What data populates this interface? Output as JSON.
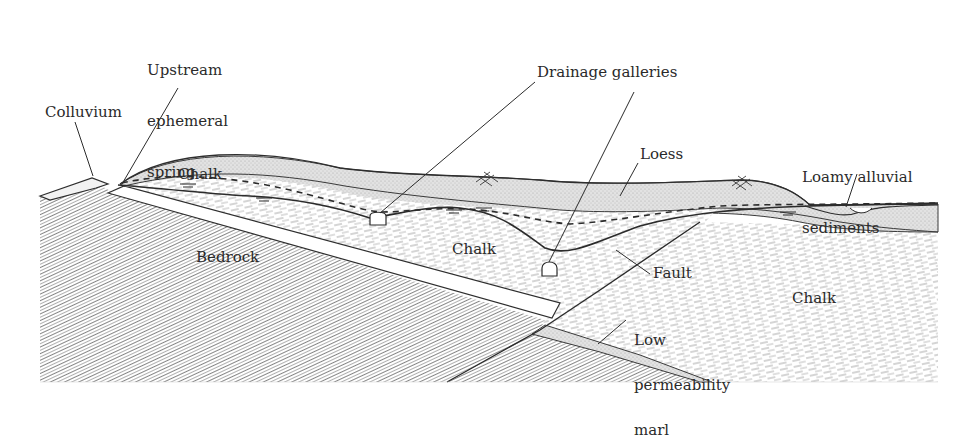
{
  "figure": {
    "type": "geological cross-section",
    "colors": {
      "line": "#2e2e2e",
      "hatch_bedrock": "#8a8a8a",
      "hatch_chalk": "#9a9a9a",
      "loess_fill": "#d6d6d6",
      "marl_fill": "#dedede",
      "background": "#ffffff"
    }
  },
  "labels": {
    "upstream_spring": [
      "Upstream",
      "ephemeral",
      "spring"
    ],
    "colluvium": "Colluvium",
    "drainage_galleries": "Drainage galleries",
    "loess": "Loess",
    "loamy_alluvial": [
      "Loamy alluvial",
      "sediments"
    ],
    "chalk_upper": "Chalk",
    "chalk_middle": "Chalk",
    "chalk_right": "Chalk",
    "bedrock": "Bedrock",
    "fault": "Fault",
    "marl": [
      "Low",
      "permeability",
      "marl"
    ]
  },
  "legend_symbols": {
    "water_table_dashed": "water-table-dashed-line",
    "piezometric_solid": "piezometric-solid-line",
    "water_level_marker": "water-level-triangle",
    "cross_hatch": "cross-hatch-marker",
    "gallery_tunnel": "drainage-gallery-tunnel"
  }
}
